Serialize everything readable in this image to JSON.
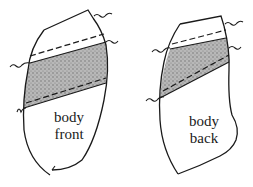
{
  "diagram": {
    "pieces": [
      {
        "id": "front",
        "label_line1": "body",
        "label_line2": "front"
      },
      {
        "id": "back",
        "label_line1": "body",
        "label_line2": "back"
      }
    ],
    "colors": {
      "line": "#1a1a1a",
      "shading": "#9a9a9a",
      "background": "#ffffff"
    }
  }
}
